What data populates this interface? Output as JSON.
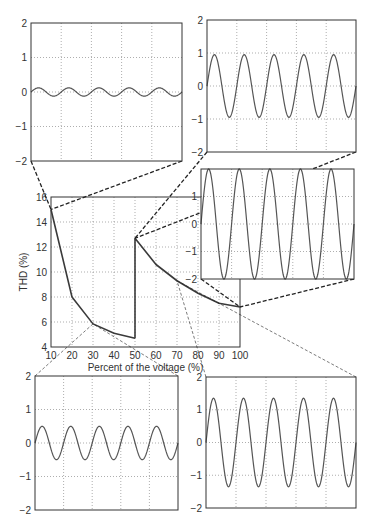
{
  "chart_data": [
    {
      "id": "main",
      "type": "line",
      "title": "",
      "xlabel": "Percent of the voltage (%)",
      "ylabel": "THD (%)",
      "xlim": [
        10,
        100
      ],
      "ylim": [
        4,
        16
      ],
      "xticks": [
        10,
        20,
        30,
        40,
        50,
        60,
        70,
        80,
        90,
        100
      ],
      "yticks": [
        4,
        6,
        8,
        10,
        12,
        14,
        16
      ],
      "grid": true,
      "series": [
        {
          "name": "THD segment 1",
          "x": [
            10,
            20,
            30,
            40,
            50
          ],
          "y": [
            15.0,
            8.0,
            5.85,
            5.1,
            4.7
          ]
        },
        {
          "name": "THD segment 2",
          "x": [
            50,
            50,
            60,
            70,
            80,
            90,
            100
          ],
          "y": [
            4.7,
            12.7,
            10.6,
            9.3,
            8.3,
            7.5,
            7.2
          ]
        }
      ]
    },
    {
      "id": "inset-top-left",
      "type": "line",
      "linked_point": [
        10,
        15.0
      ],
      "ylim": [
        -2,
        2
      ],
      "yticks": [
        -2,
        -1,
        0,
        1,
        2
      ],
      "grid": true,
      "waveform": {
        "amplitude": 0.12,
        "cycles": 5,
        "phase": "sine"
      }
    },
    {
      "id": "inset-top-right",
      "type": "line",
      "linked_point": [
        50,
        12.7
      ],
      "ylim": [
        -2,
        2
      ],
      "yticks": [
        -2,
        -1,
        0,
        1,
        2
      ],
      "grid": true,
      "waveform": {
        "amplitude": 0.95,
        "cycles": 5,
        "phase": "sine"
      }
    },
    {
      "id": "inset-middle-right",
      "type": "line",
      "linked_point": [
        100,
        7.2
      ],
      "ylim": [
        -2,
        2
      ],
      "yticks": [
        -2,
        -1,
        0,
        1,
        2
      ],
      "grid": true,
      "waveform": {
        "amplitude": 2.0,
        "cycles": 5,
        "phase": "sine"
      }
    },
    {
      "id": "inset-bottom-left",
      "type": "line",
      "linked_point": [
        30,
        5.85
      ],
      "ylim": [
        -2,
        2
      ],
      "yticks": [
        -2,
        -1,
        0,
        1,
        2
      ],
      "grid": true,
      "waveform": {
        "amplitude": 0.5,
        "cycles": 5,
        "phase": "sine"
      }
    },
    {
      "id": "inset-bottom-right",
      "type": "line",
      "linked_point": [
        70,
        9.3
      ],
      "ylim": [
        -2,
        2
      ],
      "yticks": [
        -2,
        -1,
        0,
        1,
        2
      ],
      "grid": true,
      "waveform": {
        "amplitude": 1.35,
        "cycles": 5,
        "phase": "sine"
      }
    }
  ],
  "layout": {
    "main": {
      "x0": 51,
      "y0": 197,
      "x1": 240,
      "y1": 347
    },
    "insets": {
      "inset-top-left": {
        "x0": 31,
        "y0": 23,
        "x1": 182,
        "y1": 161,
        "link": "thick",
        "show_top_label": true
      },
      "inset-top-right": {
        "x0": 207,
        "y0": 20,
        "x1": 356,
        "y1": 152,
        "link": "thick",
        "show_top_label": true
      },
      "inset-middle-right": {
        "x0": 201,
        "y0": 169,
        "x1": 354,
        "y1": 279,
        "link": "thick",
        "show_top_label": false
      },
      "inset-bottom-left": {
        "x0": 35,
        "y0": 376,
        "x1": 178,
        "y1": 510,
        "link": "thin",
        "link_edge": "top",
        "show_top_label": true
      },
      "inset-bottom-right": {
        "x0": 206,
        "y0": 377,
        "x1": 356,
        "y1": 508,
        "link": "thin",
        "link_edge": "top",
        "show_top_label": true
      }
    },
    "colors": {
      "curve": "#3a3a3a",
      "wave": "#555555",
      "grid": "#777777",
      "frame": "#333333",
      "link": "#222222"
    }
  }
}
